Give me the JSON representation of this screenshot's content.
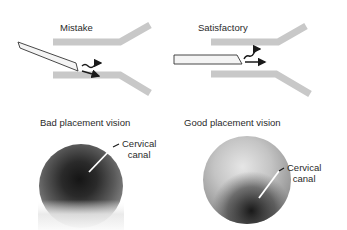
{
  "panels": {
    "top_left": {
      "title": "Mistake"
    },
    "top_right": {
      "title": "Satisfactory"
    },
    "bottom_left": {
      "title": "Bad placement vision",
      "annotation_line1": "Cervical",
      "annotation_line2": "canal"
    },
    "bottom_right": {
      "title": "Good placement vision",
      "annotation_line1": "Cervical",
      "annotation_line2": "canal"
    }
  },
  "colors": {
    "wall": "#c8c8c8",
    "scope_fill": "#f4f4f4",
    "scope_stroke": "#333333",
    "arrow": "#1a1a1a",
    "text": "#2a2a2a"
  }
}
